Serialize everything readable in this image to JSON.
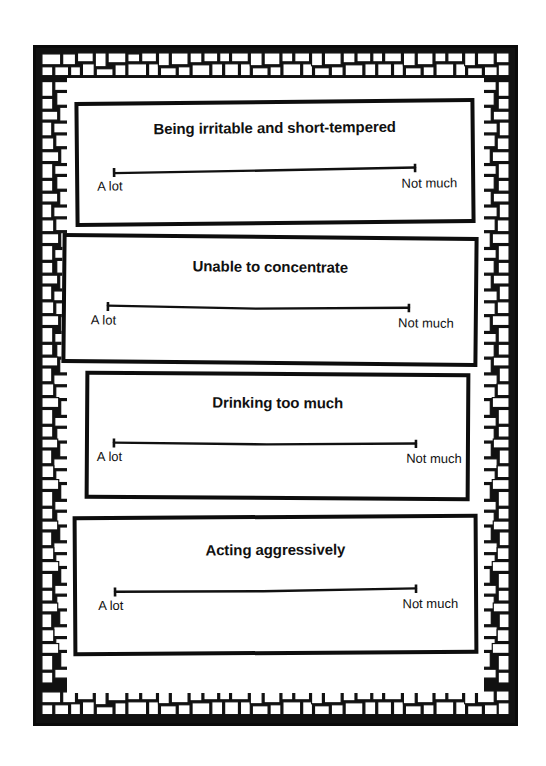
{
  "figure": {
    "kind": "visual-analogue-scale-card-set",
    "border_style": "mosaic-brick-pattern",
    "colors": {
      "ink": "#111111",
      "paper": "#ffffff"
    }
  },
  "cards": [
    {
      "title": "Being irritable and short-tempered",
      "scale": {
        "left_label": "A lot",
        "right_label": "Not much"
      }
    },
    {
      "title": "Unable to concentrate",
      "scale": {
        "left_label": "A lot",
        "right_label": "Not much"
      }
    },
    {
      "title": "Drinking too much",
      "scale": {
        "left_label": "A lot",
        "right_label": "Not much"
      }
    },
    {
      "title": "Acting aggressively",
      "scale": {
        "left_label": "A lot",
        "right_label": "Not much"
      }
    }
  ]
}
